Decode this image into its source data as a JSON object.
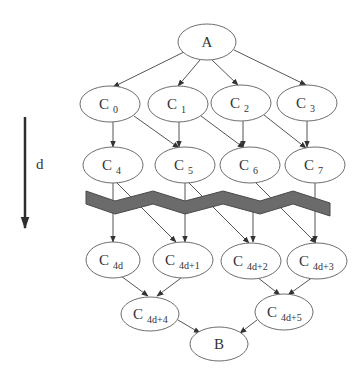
{
  "diagram": {
    "axis": {
      "label": "d",
      "direction": "down"
    },
    "nodes": {
      "A": {
        "label": "A",
        "sub": ""
      },
      "C0": {
        "label": "C",
        "sub": "0"
      },
      "C1": {
        "label": "C",
        "sub": "1"
      },
      "C2": {
        "label": "C",
        "sub": "2"
      },
      "C3": {
        "label": "C",
        "sub": "3"
      },
      "C4": {
        "label": "C",
        "sub": "4"
      },
      "C5": {
        "label": "C",
        "sub": "5"
      },
      "C6": {
        "label": "C",
        "sub": "6"
      },
      "C7": {
        "label": "C",
        "sub": "7"
      },
      "C4d": {
        "label": "C",
        "sub": "4d"
      },
      "C4d1": {
        "label": "C",
        "sub": "4d+1"
      },
      "C4d2": {
        "label": "C",
        "sub": "4d+2"
      },
      "C4d3": {
        "label": "C",
        "sub": "4d+3"
      },
      "C4d4": {
        "label": "C",
        "sub": "4d+4"
      },
      "C4d5": {
        "label": "C",
        "sub": "4d+5"
      },
      "B": {
        "label": "B",
        "sub": ""
      }
    },
    "edges": [
      [
        "A",
        "C0"
      ],
      [
        "A",
        "C1"
      ],
      [
        "A",
        "C2"
      ],
      [
        "A",
        "C3"
      ],
      [
        "C0",
        "C4"
      ],
      [
        "C0",
        "C5"
      ],
      [
        "C1",
        "C5"
      ],
      [
        "C1",
        "C6"
      ],
      [
        "C2",
        "C6"
      ],
      [
        "C2",
        "C7"
      ],
      [
        "C3",
        "C7"
      ],
      [
        "C4",
        "C4d"
      ],
      [
        "C4",
        "C4d1"
      ],
      [
        "C5",
        "C4d1"
      ],
      [
        "C5",
        "C4d2"
      ],
      [
        "C6",
        "C4d2"
      ],
      [
        "C6",
        "C4d3"
      ],
      [
        "C7",
        "C4d3"
      ],
      [
        "C4d",
        "C4d4"
      ],
      [
        "C4d1",
        "C4d4"
      ],
      [
        "C4d2",
        "C4d5"
      ],
      [
        "C4d3",
        "C4d5"
      ],
      [
        "C4d4",
        "B"
      ],
      [
        "C4d5",
        "B"
      ]
    ],
    "band": {
      "description": "zigzag band indicating omitted intermediate levels",
      "color": "#6b6b6b"
    }
  }
}
